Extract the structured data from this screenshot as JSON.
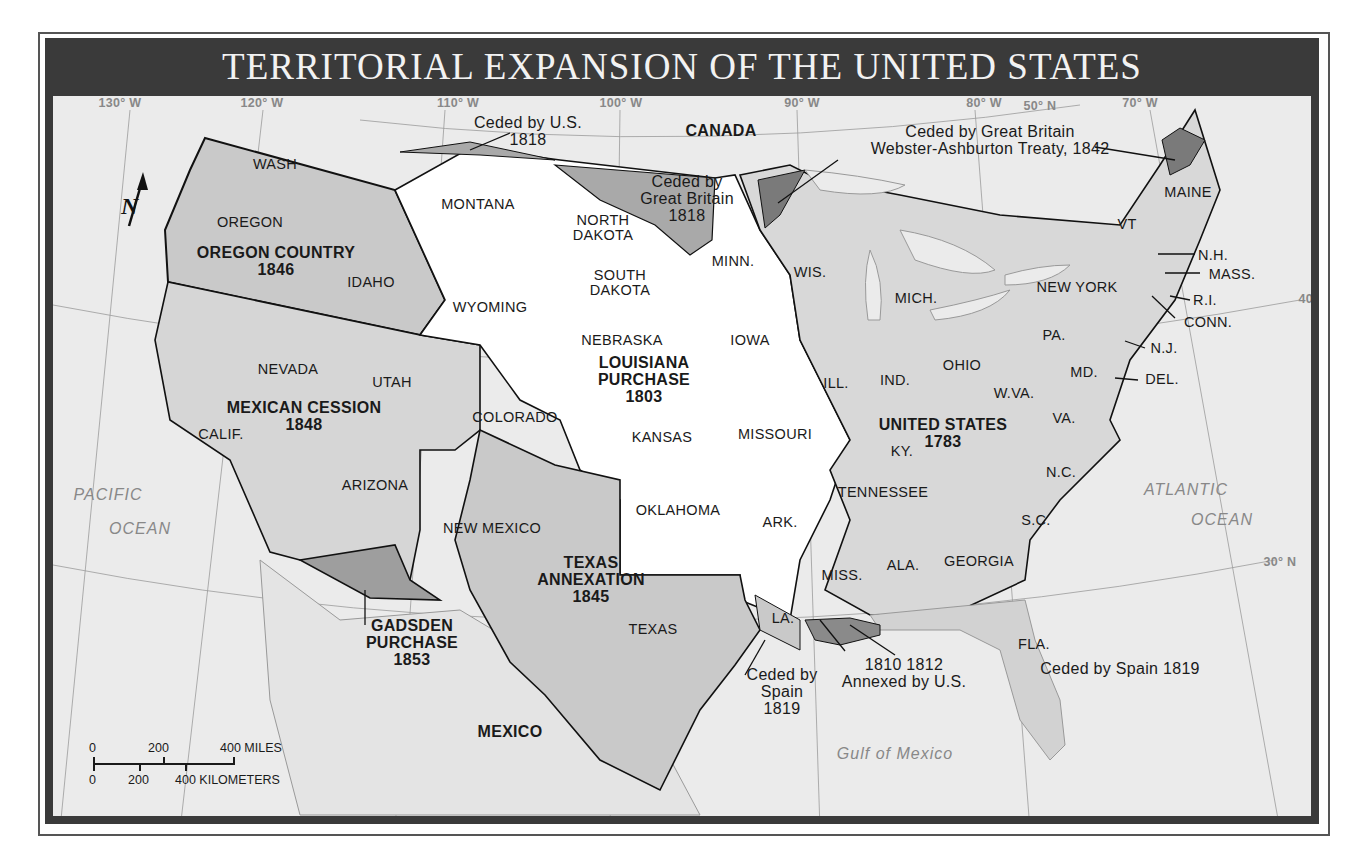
{
  "title": "TERRITORIAL EXPANSION OF THE UNITED STATES",
  "colors": {
    "frame": "#3a3a3a",
    "water": "#ebebeb",
    "us_1783": "#d8d8d8",
    "louisiana": "#ffffff",
    "acquisition": "#d2d2d2",
    "dark_cession": "#7a7a7a",
    "medium_cession": "#a8a8a8"
  },
  "grid_labels": [
    {
      "text": "130° W",
      "x": 120,
      "y": 104
    },
    {
      "text": "120° W",
      "x": 262,
      "y": 104
    },
    {
      "text": "110° W",
      "x": 458,
      "y": 104
    },
    {
      "text": "100° W",
      "x": 621,
      "y": 104
    },
    {
      "text": "90° W",
      "x": 802,
      "y": 104
    },
    {
      "text": "80° W",
      "x": 984,
      "y": 104
    },
    {
      "text": "50° N",
      "x": 1040,
      "y": 107
    },
    {
      "text": "70° W",
      "x": 1140,
      "y": 104
    },
    {
      "text": "40° N",
      "x": 1315,
      "y": 300
    },
    {
      "text": "30° N",
      "x": 1280,
      "y": 563
    }
  ],
  "regions": [
    {
      "name": "OREGON COUNTRY",
      "year": "1846",
      "x": 276,
      "y": 262
    },
    {
      "name": "MEXICAN CESSION",
      "year": "1848",
      "x": 304,
      "y": 417
    },
    {
      "name": "LOUISIANA PURCHASE",
      "year": "1803",
      "x": 644,
      "y": 380
    },
    {
      "name": "UNITED STATES",
      "year": "1783",
      "x": 943,
      "y": 434
    },
    {
      "name": "TEXAS ANNEXATION",
      "year": "1845",
      "x": 591,
      "y": 580
    },
    {
      "name": "GADSDEN PURCHASE",
      "year": "1853",
      "x": 412,
      "y": 643
    }
  ],
  "states": [
    {
      "text": "WASH",
      "x": 275,
      "y": 165
    },
    {
      "text": "OREGON",
      "x": 250,
      "y": 223
    },
    {
      "text": "IDAHO",
      "x": 371,
      "y": 283
    },
    {
      "text": "MONTANA",
      "x": 478,
      "y": 205
    },
    {
      "text": "NORTH\nDAKOTA",
      "x": 603,
      "y": 228
    },
    {
      "text": "SOUTH\nDAKOTA",
      "x": 620,
      "y": 283
    },
    {
      "text": "WYOMING",
      "x": 490,
      "y": 308
    },
    {
      "text": "NEBRASKA",
      "x": 622,
      "y": 341
    },
    {
      "text": "NEVADA",
      "x": 288,
      "y": 370
    },
    {
      "text": "UTAH",
      "x": 392,
      "y": 383
    },
    {
      "text": "COLORADO",
      "x": 515,
      "y": 418
    },
    {
      "text": "KANSAS",
      "x": 662,
      "y": 438
    },
    {
      "text": "CALIF.",
      "x": 221,
      "y": 435
    },
    {
      "text": "ARIZONA",
      "x": 375,
      "y": 486
    },
    {
      "text": "NEW MEXICO",
      "x": 492,
      "y": 529
    },
    {
      "text": "OKLAHOMA",
      "x": 678,
      "y": 511
    },
    {
      "text": "TEXAS",
      "x": 653,
      "y": 630
    },
    {
      "text": "MINN.",
      "x": 733,
      "y": 262
    },
    {
      "text": "WIS.",
      "x": 810,
      "y": 273
    },
    {
      "text": "IOWA",
      "x": 750,
      "y": 341
    },
    {
      "text": "MICH.",
      "x": 916,
      "y": 299
    },
    {
      "text": "ILL.",
      "x": 836,
      "y": 384
    },
    {
      "text": "IND.",
      "x": 895,
      "y": 381
    },
    {
      "text": "OHIO",
      "x": 962,
      "y": 366
    },
    {
      "text": "MISSOURI",
      "x": 775,
      "y": 435
    },
    {
      "text": "KY.",
      "x": 902,
      "y": 452
    },
    {
      "text": "W.VA.",
      "x": 1014,
      "y": 394
    },
    {
      "text": "VA.",
      "x": 1064,
      "y": 419
    },
    {
      "text": "MD.",
      "x": 1084,
      "y": 373
    },
    {
      "text": "PA.",
      "x": 1054,
      "y": 336
    },
    {
      "text": "NEW YORK",
      "x": 1077,
      "y": 288
    },
    {
      "text": "VT",
      "x": 1127,
      "y": 225
    },
    {
      "text": "MAINE",
      "x": 1188,
      "y": 193
    },
    {
      "text": "TENNESSEE",
      "x": 883,
      "y": 493
    },
    {
      "text": "N.C.",
      "x": 1061,
      "y": 473
    },
    {
      "text": "S.C.",
      "x": 1036,
      "y": 521
    },
    {
      "text": "ARK.",
      "x": 780,
      "y": 523
    },
    {
      "text": "MISS.",
      "x": 842,
      "y": 576
    },
    {
      "text": "ALA.",
      "x": 903,
      "y": 566
    },
    {
      "text": "GEORGIA",
      "x": 979,
      "y": 562
    },
    {
      "text": "LA.",
      "x": 783,
      "y": 619
    },
    {
      "text": "FLA.",
      "x": 1034,
      "y": 645
    }
  ],
  "callouts": [
    {
      "text": "N.H.",
      "x": 1213,
      "y": 256
    },
    {
      "text": "MASS.",
      "x": 1232,
      "y": 275
    },
    {
      "text": "R.I.",
      "x": 1205,
      "y": 301
    },
    {
      "text": "CONN.",
      "x": 1208,
      "y": 323
    },
    {
      "text": "N.J.",
      "x": 1164,
      "y": 349
    },
    {
      "text": "DEL.",
      "x": 1162,
      "y": 380
    }
  ],
  "notes": [
    {
      "text": "Ceded by U.S.\n1818",
      "x": 528,
      "y": 132
    },
    {
      "text": "Ceded by Great Britain\nWebster-Ashburton Treaty, 1842",
      "x": 990,
      "y": 141
    },
    {
      "text": "Ceded by\nGreat Britain\n1818",
      "x": 687,
      "y": 199
    },
    {
      "text": "Ceded by\nSpain\n1819",
      "x": 782,
      "y": 692
    },
    {
      "text": "1810 1812\nAnnexed by U.S.",
      "x": 904,
      "y": 674
    },
    {
      "text": "Ceded by Spain 1819",
      "x": 1120,
      "y": 669
    }
  ],
  "countries": [
    {
      "text": "CANADA",
      "x": 721,
      "y": 131
    },
    {
      "text": "MEXICO",
      "x": 510,
      "y": 732
    }
  ],
  "oceans": [
    {
      "text": "PACIFIC",
      "x": 108,
      "y": 495
    },
    {
      "text": "OCEAN",
      "x": 140,
      "y": 529
    },
    {
      "text": "ATLANTIC",
      "x": 1186,
      "y": 490
    },
    {
      "text": "OCEAN",
      "x": 1222,
      "y": 520
    },
    {
      "text": "Gulf of Mexico",
      "x": 895,
      "y": 754
    }
  ],
  "scale_bar": {
    "miles": [
      "0",
      "200",
      "400 MILES"
    ],
    "kilometers": [
      "0",
      "200",
      "400 KILOMETERS"
    ]
  },
  "compass": {
    "label": "N"
  }
}
